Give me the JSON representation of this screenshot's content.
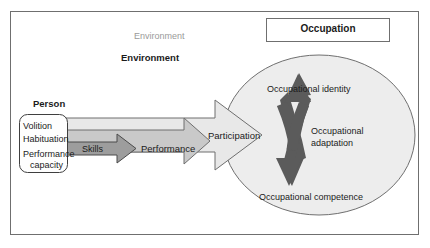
{
  "diagram": {
    "title_box": {
      "label": "Occupation",
      "border_color": "#6f6f6f",
      "fill": "#ffffff"
    },
    "environment_label_faint": "Environment",
    "environment_label_bold": "Environment",
    "person_box": {
      "heading": "Person",
      "items": [
        "Volition",
        "Habituation",
        "Performance",
        "capacity"
      ],
      "fill": "#fefefe",
      "border_color": "#3f3f3f"
    },
    "arrows": {
      "participation": {
        "label": "Participation",
        "fill": "#e8e8e8",
        "stroke": "#6f6f6f"
      },
      "performance": {
        "label": "Performance",
        "fill": "#c9c9c9",
        "stroke": "#6f6f6f"
      },
      "skills": {
        "label": "Skills",
        "fill": "#9d9d9d",
        "stroke": "#4a4a4a"
      }
    },
    "outcome_circle": {
      "fill": "#ededed",
      "stroke": "#6f6f6f",
      "labels": {
        "identity": "Occupational identity",
        "adaptation_line1": "Occupational",
        "adaptation_line2": "adaptation",
        "competence": "Occupational competence"
      },
      "cross_arrow": {
        "fill": "#5b5b5b",
        "name": "occupational-adaptation-cross-arrow"
      }
    },
    "frame": {
      "stroke": "#6f6f6f"
    }
  }
}
